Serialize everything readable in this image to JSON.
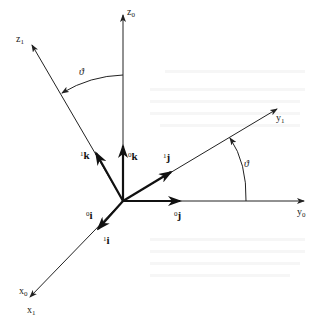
{
  "diagram": {
    "origin": [
      123,
      201
    ],
    "axes": [
      {
        "id": "z0",
        "base": "z",
        "sub": "0",
        "end": [
          123,
          14
        ],
        "label_pos": [
          127,
          14
        ]
      },
      {
        "id": "z1",
        "base": "z",
        "sub": "1",
        "end": [
          31,
          43
        ],
        "label_pos": [
          16,
          41
        ]
      },
      {
        "id": "y0",
        "base": "y",
        "sub": "0",
        "end": [
          305,
          201
        ],
        "label_pos": [
          298,
          215
        ]
      },
      {
        "id": "y1",
        "base": "y",
        "sub": "1",
        "end": [
          278,
          108
        ],
        "label_pos": [
          276,
          120
        ]
      },
      {
        "id": "x0x1",
        "base": "x",
        "sub": "0",
        "end": [
          29,
          298
        ],
        "label_pos": [
          19,
          294
        ]
      }
    ],
    "extra_label": {
      "base": "x",
      "sub": "1",
      "pos": [
        27,
        315
      ]
    },
    "unit_vectors": [
      {
        "id": "0k",
        "sup": "0",
        "letter": "k",
        "end": [
          123,
          145
        ],
        "label_pos": [
          128,
          158
        ]
      },
      {
        "id": "1k",
        "sup": "1",
        "letter": "k",
        "end": [
          96,
          152
        ],
        "label_pos": [
          80,
          158
        ]
      },
      {
        "id": "1j",
        "sup": "1",
        "letter": "j",
        "end": [
          172,
          174
        ],
        "label_pos": [
          163,
          160
        ]
      },
      {
        "id": "0j",
        "sup": "0",
        "letter": "j",
        "end": [
          180,
          201
        ],
        "label_pos": [
          174,
          218
        ]
      },
      {
        "id": "0i",
        "sup": "0",
        "letter": "i",
        "end": [
          98,
          231
        ],
        "label_pos": [
          85,
          218
        ]
      },
      {
        "id": "1i",
        "label_extra": true,
        "sup": "1",
        "letter": "i",
        "label_pos": [
          103,
          243
        ]
      }
    ],
    "angles": [
      {
        "id": "theta-z",
        "symbol": "ϑ",
        "label_pos": [
          78,
          73
        ]
      },
      {
        "id": "theta-y",
        "symbol": "ϑ",
        "label_pos": [
          244,
          166
        ]
      }
    ],
    "colors": {
      "line": "#222222",
      "background": "#ffffff"
    }
  }
}
